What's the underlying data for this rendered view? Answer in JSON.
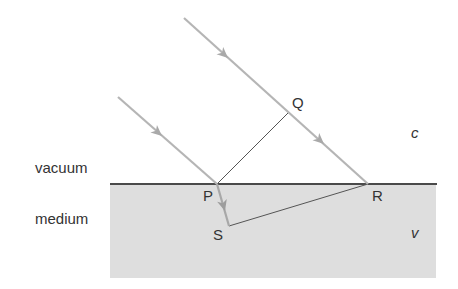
{
  "diagram": {
    "type": "ray-refraction-wavefront",
    "colors": {
      "background": "#ffffff",
      "medium_fill": "#dedede",
      "interface_line": "#4a4a4a",
      "ray": "#b5b5b5",
      "construction_line": "#555555",
      "label": "#333333"
    },
    "regions": {
      "upper": {
        "label": "vacuum",
        "speed_label": "c"
      },
      "lower": {
        "label": "medium",
        "speed_label": "v"
      }
    },
    "points": {
      "P": {
        "label": "P",
        "x": 217,
        "y": 184
      },
      "Q": {
        "label": "Q",
        "x": 289,
        "y": 112
      },
      "R": {
        "label": "R",
        "x": 368,
        "y": 184
      },
      "S": {
        "label": "S",
        "x": 229,
        "y": 226
      }
    },
    "rays": [
      {
        "name": "incident-ray-upper",
        "from": [
          184,
          18
        ],
        "to": [
          368,
          184
        ],
        "arrows": [
          [
            226,
            56
          ],
          [
            322,
            142
          ]
        ]
      },
      {
        "name": "incident-ray-lower",
        "from": [
          118,
          97
        ],
        "to": [
          217,
          184
        ],
        "arrows": [
          [
            160,
            134
          ]
        ]
      },
      {
        "name": "refracted-ray",
        "from": [
          217,
          184
        ],
        "to": [
          229,
          226
        ],
        "arrows": [
          [
            224,
            208
          ]
        ]
      }
    ],
    "construction_lines": [
      {
        "name": "wavefront-PQ",
        "from": "P",
        "to": "Q"
      },
      {
        "name": "wavefront-SR",
        "from": "S",
        "to": "R"
      }
    ]
  }
}
